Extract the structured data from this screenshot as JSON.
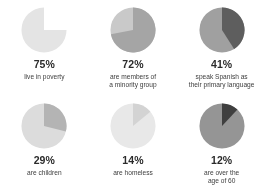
{
  "document": {
    "type": "statistics-infographic",
    "background_color": "#ffffff",
    "text_color": "#2b2b2b"
  },
  "chart_data": [
    {
      "type": "pie",
      "title": "75%",
      "percent_label": "75%",
      "value": 75,
      "caption_lines": [
        "live in poverty"
      ],
      "slices": [
        {
          "name": "live in poverty",
          "value": 75,
          "color": "#e4e4e4"
        },
        {
          "name": "remainder",
          "value": 25,
          "color": "#ffffff"
        }
      ],
      "highlight_color": "#e4e4e4",
      "remainder_color": "#ffffff",
      "start_angle": 0,
      "direction": "counterclockwise"
    },
    {
      "type": "pie",
      "title": "72%",
      "percent_label": "72%",
      "value": 72,
      "caption_lines": [
        "are members of",
        "a minority group"
      ],
      "slices": [
        {
          "name": "are members of a minority group",
          "value": 72,
          "color": "#a5a5a5"
        },
        {
          "name": "remainder",
          "value": 28,
          "color": "#c9c9c9"
        }
      ],
      "highlight_color": "#a5a5a5",
      "remainder_color": "#c9c9c9",
      "start_angle": 0,
      "direction": "clockwise"
    },
    {
      "type": "pie",
      "title": "41%",
      "percent_label": "41%",
      "value": 41,
      "caption_lines": [
        "speak Spanish as",
        "their primary language"
      ],
      "slices": [
        {
          "name": "speak Spanish as their primary language",
          "value": 41,
          "color": "#5e5e5e"
        },
        {
          "name": "remainder",
          "value": 59,
          "color": "#a0a0a0"
        }
      ],
      "highlight_color": "#5e5e5e",
      "remainder_color": "#a0a0a0",
      "start_angle": 0,
      "direction": "clockwise"
    },
    {
      "type": "pie",
      "title": "29%",
      "percent_label": "29%",
      "value": 29,
      "caption_lines": [
        "are children"
      ],
      "slices": [
        {
          "name": "are children",
          "value": 29,
          "color": "#b4b4b4"
        },
        {
          "name": "remainder",
          "value": 71,
          "color": "#dcdcdc"
        }
      ],
      "highlight_color": "#b4b4b4",
      "remainder_color": "#dcdcdc",
      "start_angle": 0,
      "direction": "clockwise"
    },
    {
      "type": "pie",
      "title": "14%",
      "percent_label": "14%",
      "value": 14,
      "caption_lines": [
        "are homeless"
      ],
      "slices": [
        {
          "name": "are homeless",
          "value": 14,
          "color": "#d3d3d3"
        },
        {
          "name": "remainder",
          "value": 86,
          "color": "#e8e8e8"
        }
      ],
      "highlight_color": "#d3d3d3",
      "remainder_color": "#e8e8e8",
      "start_angle": 0,
      "direction": "clockwise"
    },
    {
      "type": "pie",
      "title": "12%",
      "percent_label": "12%",
      "value": 12,
      "caption_lines": [
        "are over the",
        "age of 60"
      ],
      "slices": [
        {
          "name": "are over the age of 60",
          "value": 12,
          "color": "#3f3f3f"
        },
        {
          "name": "remainder",
          "value": 88,
          "color": "#959595"
        }
      ],
      "highlight_color": "#3f3f3f",
      "remainder_color": "#959595",
      "start_angle": 0,
      "direction": "clockwise"
    }
  ]
}
